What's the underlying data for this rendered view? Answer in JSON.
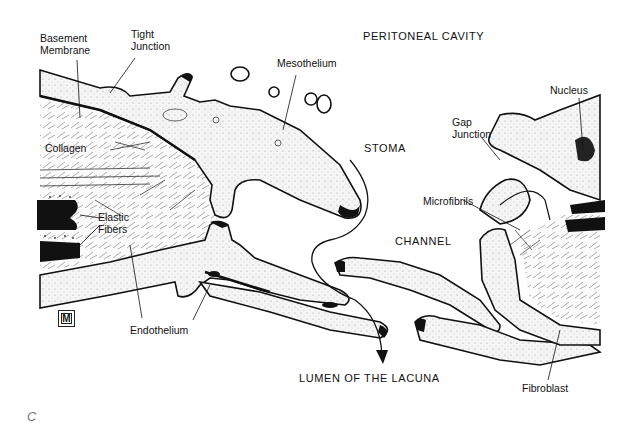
{
  "figure": {
    "panel_letter": "C",
    "regions": {
      "peritoneal_cavity": "PERITONEAL CAVITY",
      "stoma": "STOMA",
      "channel": "CHANNEL",
      "lumen": "LUMEN OF THE LACUNA"
    },
    "labels": {
      "basement_membrane_line1": "Basement",
      "basement_membrane_line2": "Membrane",
      "tight_junction_line1": "Tight",
      "tight_junction_line2": "Junction",
      "mesothelium": "Mesothelium",
      "nucleus": "Nucleus",
      "gap_junction_line1": "Gap",
      "gap_junction_line2": "Junction",
      "collagen": "Collagen",
      "elastic_fibers_line1": "Elastic",
      "elastic_fibers_line2": "Fibers",
      "microfibrils": "Microfibrils",
      "endothelium": "Endothelium",
      "fibroblast": "Fibroblast"
    },
    "logo_glyph": "M",
    "colors": {
      "ink": "#111111",
      "cell_fill": "#f4f4f4",
      "background": "#ffffff",
      "panel_letter": "#777777"
    }
  }
}
